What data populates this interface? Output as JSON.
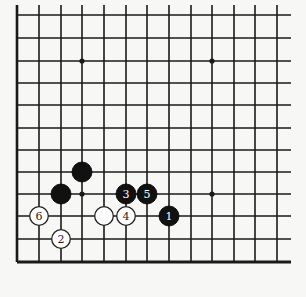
{
  "diagram": {
    "type": "go-board-fragment",
    "colors": {
      "background": "#f7f7f5",
      "line": "#1a1a1a",
      "black_stone": "#111111",
      "white_stone": "#ffffff"
    },
    "grid": {
      "x_lines": [
        17,
        39,
        61,
        82,
        104,
        126,
        147,
        169,
        191,
        212,
        234,
        255,
        277
      ],
      "y_lines": [
        15,
        38,
        61,
        83,
        105,
        128,
        150,
        172,
        194,
        216,
        239,
        262
      ],
      "left_edge": true,
      "bottom_edge": true,
      "top_open": true,
      "right_open": true
    },
    "star_points": [
      {
        "col": 3,
        "row": 2
      },
      {
        "col": 9,
        "row": 2
      },
      {
        "col": 3,
        "row": 8
      },
      {
        "col": 9,
        "row": 8
      }
    ],
    "stones": [
      {
        "color": "black",
        "col": 3,
        "row": 7,
        "label": ""
      },
      {
        "color": "black",
        "col": 2,
        "row": 8,
        "label": ""
      },
      {
        "color": "black",
        "col": 5,
        "row": 8,
        "label": "3"
      },
      {
        "color": "black",
        "col": 6,
        "row": 8,
        "label": "5"
      },
      {
        "color": "white",
        "col": 1,
        "row": 9,
        "label": "6"
      },
      {
        "color": "white",
        "col": 4,
        "row": 9,
        "label": ""
      },
      {
        "color": "white",
        "col": 5,
        "row": 9,
        "label": "4"
      },
      {
        "color": "black",
        "col": 7,
        "row": 9,
        "label": "1"
      },
      {
        "color": "white",
        "col": 2,
        "row": 10,
        "label": "2"
      }
    ]
  }
}
